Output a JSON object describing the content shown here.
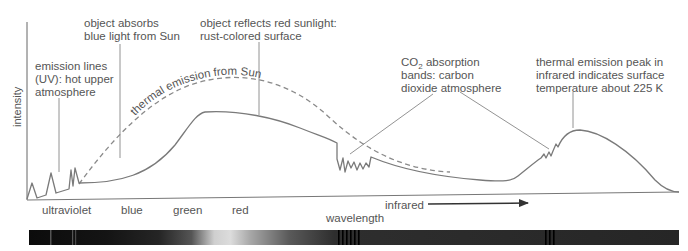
{
  "diagram": {
    "y_axis_label": "intensity",
    "x_axis_label": "wavelength",
    "band_labels": [
      {
        "id": "ultraviolet",
        "text": "ultraviolet"
      },
      {
        "id": "blue",
        "text": "blue"
      },
      {
        "id": "green",
        "text": "green"
      },
      {
        "id": "red",
        "text": "red"
      },
      {
        "id": "infrared",
        "text": "infrared"
      }
    ],
    "curve_labels": {
      "solar_thermal": "thermal emission from Sun"
    },
    "annotations": [
      {
        "id": "emission-lines",
        "lines": [
          "emission lines",
          "(UV): hot upper",
          "atmosphere"
        ]
      },
      {
        "id": "absorbs-blue",
        "lines": [
          "object absorbs",
          "blue light from Sun"
        ]
      },
      {
        "id": "reflects-red",
        "lines": [
          "object reflects red sunlight:",
          "rust-colored surface"
        ]
      },
      {
        "id": "co2-bands",
        "lines": [
          "CO",
          "2",
          " absorption",
          "bands: carbon",
          "dioxide atmosphere"
        ]
      },
      {
        "id": "thermal-peak",
        "lines": [
          "thermal emission peak in",
          "infrared indicates surface",
          "temperature about 225 K"
        ]
      }
    ],
    "colors": {
      "curve": "#7a7a7a",
      "dashed": "#8a8a8a",
      "text": "#555555",
      "axis": "#666666",
      "arrow": "#333333"
    }
  }
}
